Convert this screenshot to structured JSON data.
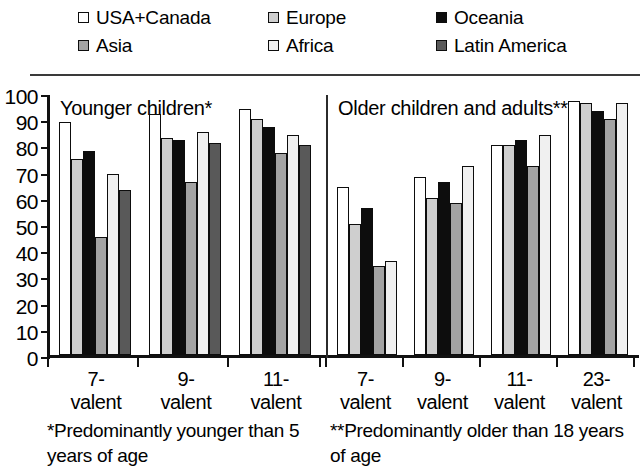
{
  "legend": {
    "items": [
      {
        "label": "USA+Canada",
        "color": "#ffffff",
        "row": 0,
        "col": 0
      },
      {
        "label": "Europe",
        "color": "#cfcfcf",
        "row": 0,
        "col": 1
      },
      {
        "label": "Oceania",
        "color": "#0d0d0d",
        "row": 0,
        "col": 2
      },
      {
        "label": "Asia",
        "color": "#a3a3a3",
        "row": 1,
        "col": 0
      },
      {
        "label": "Africa",
        "color": "#f0f0f0",
        "row": 1,
        "col": 1
      },
      {
        "label": "Latin America",
        "color": "#595959",
        "row": 1,
        "col": 2
      }
    ]
  },
  "panels": [
    {
      "title": "Younger children*"
    },
    {
      "title": "Older children and adults**"
    }
  ],
  "footnotes": {
    "left": "*Predominantly younger than 5 years of age",
    "right": "**Predominantly older than 18 years of age"
  },
  "chart_data": {
    "type": "bar",
    "title": "",
    "xlabel": "",
    "ylabel": "",
    "ylim": [
      0,
      100
    ],
    "yticks": [
      0,
      10,
      20,
      30,
      40,
      50,
      60,
      70,
      80,
      90,
      100
    ],
    "grid": false,
    "legend_position": "top",
    "panels": [
      {
        "name": "Younger children*",
        "categories": [
          "7-valent",
          "9-valent",
          "11-valent"
        ],
        "series": [
          {
            "name": "USA+Canada",
            "color": "#ffffff",
            "values": [
              89,
              92,
              94
            ]
          },
          {
            "name": "Europe",
            "color": "#cfcfcf",
            "values": [
              75,
              83,
              90
            ]
          },
          {
            "name": "Oceania",
            "color": "#0d0d0d",
            "values": [
              78,
              82,
              87
            ]
          },
          {
            "name": "Asia",
            "color": "#a3a3a3",
            "values": [
              45,
              66,
              77
            ]
          },
          {
            "name": "Africa",
            "color": "#f0f0f0",
            "values": [
              69,
              85,
              84
            ]
          },
          {
            "name": "Latin America",
            "color": "#595959",
            "values": [
              63,
              81,
              80
            ]
          }
        ]
      },
      {
        "name": "Older children and adults**",
        "categories": [
          "7-valent",
          "9-valent",
          "11-valent",
          "23-valent"
        ],
        "series": [
          {
            "name": "USA+Canada",
            "color": "#ffffff",
            "values": [
              64,
              68,
              80,
              97
            ]
          },
          {
            "name": "Europe",
            "color": "#cfcfcf",
            "values": [
              50,
              60,
              80,
              96
            ]
          },
          {
            "name": "Oceania",
            "color": "#0d0d0d",
            "values": [
              56,
              66,
              82,
              93
            ]
          },
          {
            "name": "Asia",
            "color": "#a3a3a3",
            "values": [
              34,
              58,
              72,
              90
            ]
          },
          {
            "name": "Africa",
            "color": "#f0f0f0",
            "values": [
              36,
              72,
              84,
              96
            ]
          },
          {
            "name": "Latin America",
            "color": "#595959",
            "values": [
              null,
              null,
              null,
              null
            ]
          }
        ]
      }
    ],
    "xtick_labels": [
      {
        "line1": "7-",
        "line2": "valent"
      },
      {
        "line1": "9-",
        "line2": "valent"
      },
      {
        "line1": "11-",
        "line2": "valent"
      },
      {
        "line1": "7-",
        "line2": "valent"
      },
      {
        "line1": "9-",
        "line2": "valent"
      },
      {
        "line1": "11-",
        "line2": "valent"
      },
      {
        "line1": "23-",
        "line2": "valent"
      }
    ]
  }
}
